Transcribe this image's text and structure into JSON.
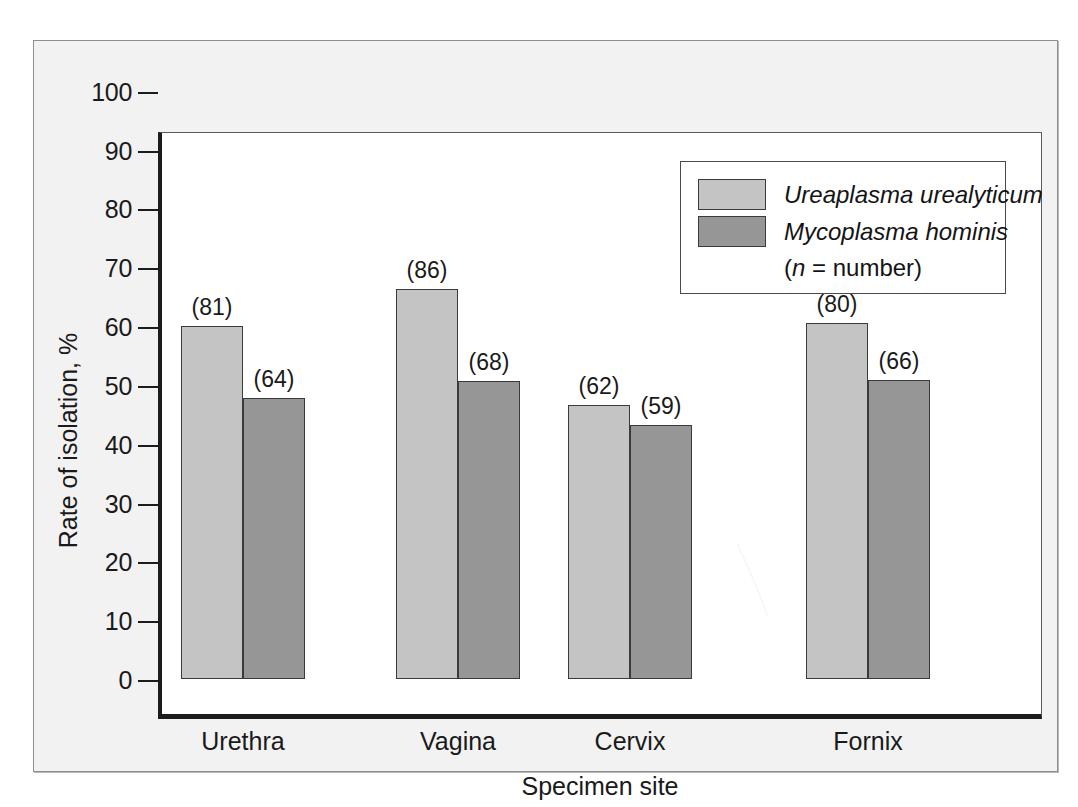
{
  "figure": {
    "background_color": "#f2f2f2",
    "plot_background_color": "#ffffff"
  },
  "chart_data": {
    "type": "bar",
    "title": "",
    "xlabel": "Specimen site",
    "ylabel": "Rate of isolation, %",
    "ylim": [
      0,
      100
    ],
    "ytick_labels": [
      "100",
      "90",
      "80",
      "70",
      "60",
      "50",
      "40",
      "30",
      "20",
      "10",
      "0"
    ],
    "ytick_values": [
      100,
      90,
      80,
      70,
      60,
      50,
      40,
      30,
      20,
      10,
      0
    ],
    "grid": false,
    "legend_position": "top-right",
    "categories": [
      "Urethra",
      "Vagina",
      "Cervix",
      "Fornix"
    ],
    "series": [
      {
        "name": "Ureaplasma urealyticum",
        "color": "#c4c4c4",
        "values": [
          60.2,
          66.5,
          46.7,
          60.6
        ],
        "point_labels": [
          "(81)",
          "(86)",
          "(62)",
          "(80)"
        ],
        "n": [
          81,
          86,
          62,
          80
        ]
      },
      {
        "name": "Mycoplasma hominis",
        "color": "#969696",
        "values": [
          47.9,
          50.8,
          43.3,
          51.0
        ],
        "point_labels": [
          "(64)",
          "(68)",
          "(59)",
          "(66)"
        ],
        "n": [
          64,
          68,
          59,
          66
        ]
      }
    ],
    "annotations": [
      "(n = number)"
    ]
  },
  "legend": {
    "entries": [
      {
        "label": "Ureaplasma urealyticum",
        "color": "#c4c4c4"
      },
      {
        "label": "Mycoplasma hominis",
        "color": "#969696"
      }
    ],
    "note_prefix": "(",
    "note_italic": "n",
    "note_suffix": " = number)"
  },
  "artifact": {
    "name": "white-scan-scratch",
    "color": "#ffffff"
  }
}
